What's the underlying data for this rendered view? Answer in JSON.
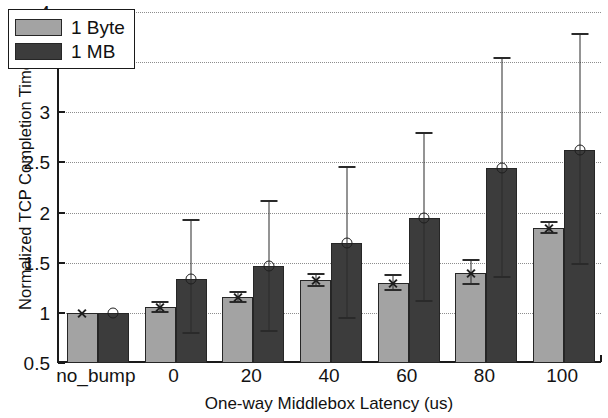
{
  "chart_data": {
    "type": "bar",
    "title": "",
    "xlabel": "One-way Middlebox Latency (us)",
    "ylabel": "Normalized TCP Completion Time",
    "categories": [
      "no_bump",
      "0",
      "20",
      "40",
      "60",
      "80",
      "100"
    ],
    "ylim": [
      0.5,
      4
    ],
    "yticks": [
      0.5,
      1,
      1.5,
      2,
      2.5,
      3,
      3.5,
      4
    ],
    "ytick_labels": [
      "0.5",
      "1",
      "1.5",
      "2",
      "2.5",
      "3",
      "3.5",
      "4"
    ],
    "grid": true,
    "grid_axis": "y",
    "grid_style": "dotted",
    "legend_position": "upper left",
    "series": [
      {
        "name": "1 Byte",
        "color": "#a3a3a3",
        "marker": "x",
        "values": [
          1.0,
          1.06,
          1.16,
          1.33,
          1.3,
          1.4,
          1.85
        ],
        "err_low": [
          1.0,
          1.01,
          1.11,
          1.27,
          1.23,
          1.29,
          1.8
        ],
        "err_high": [
          1.0,
          1.11,
          1.21,
          1.39,
          1.38,
          1.53,
          1.91
        ]
      },
      {
        "name": "1 MB",
        "color": "#3c3c3c",
        "marker": "o",
        "values": [
          1.0,
          1.34,
          1.47,
          1.7,
          1.95,
          2.44,
          2.62
        ],
        "err_low": [
          1.0,
          0.8,
          0.82,
          0.95,
          1.12,
          1.36,
          1.49
        ],
        "err_high": [
          1.0,
          1.93,
          2.12,
          2.45,
          2.79,
          3.54,
          3.78
        ]
      }
    ]
  },
  "legend": {
    "items": [
      {
        "label": "1 Byte",
        "series": 0
      },
      {
        "label": "1 MB",
        "series": 1
      }
    ]
  },
  "axes": {
    "y_title": "Normalized TCP Completion Time",
    "x_title": "One-way Middlebox Latency (us)"
  }
}
